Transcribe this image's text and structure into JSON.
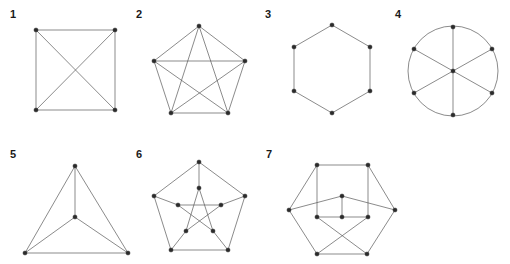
{
  "page": {
    "background": "#ffffff",
    "width": 510,
    "height": 264,
    "edge_color": "#595959",
    "vertex_color": "#2b2b2b",
    "label_color": "#1a1a1a",
    "cropped_top_text": ""
  },
  "figures": [
    {
      "id": "figure-1",
      "label": "1",
      "label_x": 10,
      "label_y": 18,
      "name": "complete-graph-k4-square-drawing",
      "vertex_count": 4,
      "edge_count": 6,
      "vertices": [
        {
          "name": "v1",
          "x": 36,
          "y": 30
        },
        {
          "name": "v2",
          "x": 115,
          "y": 30
        },
        {
          "name": "v3",
          "x": 115,
          "y": 110
        },
        {
          "name": "v4",
          "x": 36,
          "y": 110
        }
      ],
      "edges": [
        [
          0,
          1
        ],
        [
          1,
          2
        ],
        [
          2,
          3
        ],
        [
          3,
          0
        ],
        [
          0,
          2
        ],
        [
          1,
          3
        ]
      ],
      "arcs": []
    },
    {
      "id": "figure-2",
      "label": "2",
      "label_x": 136,
      "label_y": 18,
      "name": "complete-graph-k5-pentagon-drawing",
      "vertex_count": 5,
      "edge_count": 10,
      "vertices": [
        {
          "name": "v1",
          "x": 199,
          "y": 26
        },
        {
          "name": "v2",
          "x": 245,
          "y": 61
        },
        {
          "name": "v3",
          "x": 228,
          "y": 113
        },
        {
          "name": "v4",
          "x": 171,
          "y": 113
        },
        {
          "name": "v5",
          "x": 154,
          "y": 61
        }
      ],
      "edges": [
        [
          0,
          1
        ],
        [
          1,
          2
        ],
        [
          2,
          3
        ],
        [
          3,
          4
        ],
        [
          4,
          0
        ],
        [
          0,
          2
        ],
        [
          0,
          3
        ],
        [
          1,
          3
        ],
        [
          1,
          4
        ],
        [
          2,
          4
        ]
      ],
      "arcs": []
    },
    {
      "id": "figure-3",
      "label": "3",
      "label_x": 265,
      "label_y": 18,
      "name": "cycle-graph-c6-hexagon",
      "vertex_count": 6,
      "edge_count": 6,
      "vertices": [
        {
          "name": "v1",
          "x": 332,
          "y": 25
        },
        {
          "name": "v2",
          "x": 370,
          "y": 47
        },
        {
          "name": "v3",
          "x": 370,
          "y": 91
        },
        {
          "name": "v4",
          "x": 332,
          "y": 113
        },
        {
          "name": "v5",
          "x": 294,
          "y": 91
        },
        {
          "name": "v6",
          "x": 294,
          "y": 47
        }
      ],
      "edges": [
        [
          0,
          1
        ],
        [
          1,
          2
        ],
        [
          2,
          3
        ],
        [
          3,
          4
        ],
        [
          4,
          5
        ],
        [
          5,
          0
        ]
      ],
      "arcs": []
    },
    {
      "id": "figure-4",
      "label": "4",
      "label_x": 395,
      "label_y": 18,
      "name": "wheel-graph-w6-circle-with-three-diameters",
      "vertex_count": 7,
      "edge_count": 9,
      "vertices": [
        {
          "name": "v-top",
          "x": 453,
          "y": 27
        },
        {
          "name": "v-upper-right",
          "x": 492,
          "y": 49
        },
        {
          "name": "v-lower-right",
          "x": 492,
          "y": 93
        },
        {
          "name": "v-bottom",
          "x": 453,
          "y": 115
        },
        {
          "name": "v-lower-left",
          "x": 414,
          "y": 93
        },
        {
          "name": "v-upper-left",
          "x": 414,
          "y": 49
        },
        {
          "name": "v-center",
          "x": 453,
          "y": 71
        }
      ],
      "edges": [
        [
          0,
          6
        ],
        [
          6,
          3
        ],
        [
          1,
          6
        ],
        [
          6,
          4
        ],
        [
          2,
          6
        ],
        [
          6,
          5
        ]
      ],
      "arcs": [
        {
          "name": "outer-circle",
          "cx": 453,
          "cy": 71,
          "r": 45
        }
      ]
    },
    {
      "id": "figure-5",
      "label": "5",
      "label_x": 10,
      "label_y": 158,
      "name": "complete-graph-k4-planar-triangle-drawing",
      "vertex_count": 4,
      "edge_count": 6,
      "vertices": [
        {
          "name": "v-apex",
          "x": 75,
          "y": 166
        },
        {
          "name": "v-center",
          "x": 75,
          "y": 217
        },
        {
          "name": "v-bottom-left",
          "x": 25,
          "y": 253
        },
        {
          "name": "v-bottom-right",
          "x": 128,
          "y": 253
        }
      ],
      "edges": [
        [
          0,
          2
        ],
        [
          0,
          3
        ],
        [
          2,
          3
        ],
        [
          0,
          1
        ],
        [
          1,
          2
        ],
        [
          1,
          3
        ]
      ],
      "arcs": []
    },
    {
      "id": "figure-6",
      "label": "6",
      "label_x": 136,
      "label_y": 158,
      "name": "petersen-graph-standard-drawing",
      "vertex_count": 10,
      "edge_count": 15,
      "vertices": [
        {
          "name": "outer-1",
          "x": 199,
          "y": 162
        },
        {
          "name": "outer-2",
          "x": 245,
          "y": 196
        },
        {
          "name": "outer-3",
          "x": 228,
          "y": 250
        },
        {
          "name": "outer-4",
          "x": 171,
          "y": 250
        },
        {
          "name": "outer-5",
          "x": 154,
          "y": 196
        },
        {
          "name": "inner-1",
          "x": 199,
          "y": 188
        },
        {
          "name": "inner-2",
          "x": 221,
          "y": 205
        },
        {
          "name": "inner-3",
          "x": 213,
          "y": 231
        },
        {
          "name": "inner-4",
          "x": 186,
          "y": 231
        },
        {
          "name": "inner-5",
          "x": 178,
          "y": 205
        }
      ],
      "edges": [
        [
          0,
          1
        ],
        [
          1,
          2
        ],
        [
          2,
          3
        ],
        [
          3,
          4
        ],
        [
          4,
          0
        ],
        [
          0,
          5
        ],
        [
          1,
          6
        ],
        [
          2,
          7
        ],
        [
          3,
          8
        ],
        [
          4,
          9
        ],
        [
          5,
          7
        ],
        [
          7,
          9
        ],
        [
          9,
          6
        ],
        [
          6,
          8
        ],
        [
          8,
          5
        ]
      ],
      "arcs": []
    },
    {
      "id": "figure-7",
      "label": "7",
      "label_x": 266,
      "label_y": 158,
      "name": "petersen-graph-alternate-drawing",
      "vertex_count": 10,
      "edge_count": 15,
      "vertices": [
        {
          "name": "outer-top-left",
          "x": 317,
          "y": 165
        },
        {
          "name": "outer-top-right",
          "x": 368,
          "y": 165
        },
        {
          "name": "outer-right",
          "x": 395,
          "y": 210
        },
        {
          "name": "outer-bottom-right",
          "x": 367,
          "y": 254
        },
        {
          "name": "outer-bottom-left",
          "x": 317,
          "y": 254
        },
        {
          "name": "outer-left",
          "x": 289,
          "y": 210
        },
        {
          "name": "inner-top",
          "x": 342,
          "y": 196
        },
        {
          "name": "inner-left",
          "x": 317,
          "y": 217
        },
        {
          "name": "inner-center",
          "x": 342,
          "y": 217
        },
        {
          "name": "inner-right",
          "x": 368,
          "y": 217
        }
      ],
      "edges": [
        [
          0,
          1
        ],
        [
          1,
          2
        ],
        [
          2,
          3
        ],
        [
          3,
          4
        ],
        [
          4,
          5
        ],
        [
          5,
          0
        ],
        [
          0,
          7
        ],
        [
          1,
          9
        ],
        [
          5,
          6
        ],
        [
          2,
          6
        ],
        [
          6,
          8
        ],
        [
          7,
          8
        ],
        [
          8,
          9
        ],
        [
          7,
          3
        ],
        [
          9,
          4
        ]
      ],
      "arcs": []
    }
  ]
}
